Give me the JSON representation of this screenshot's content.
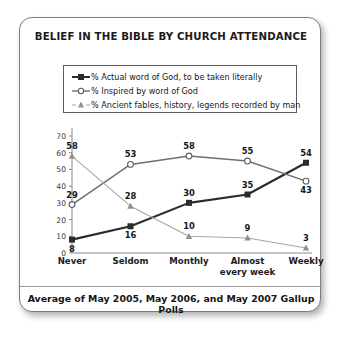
{
  "card": {
    "title": "BELIEF IN THE BIBLE BY CHURCH ATTENDANCE",
    "footer": "Average of May 2005, May 2006, and May 2007 Gallup Polls"
  },
  "legend": {
    "items": [
      {
        "label": "% Actual word of God, to be taken literally",
        "marker": "filled-square-marker",
        "color": "#2b2b2b"
      },
      {
        "label": "% Inspired by word of God",
        "marker": "open-circle-marker",
        "color": "#6f6f6f"
      },
      {
        "label": "% Ancient fables, history, legends recorded by man",
        "marker": "filled-triangle-marker",
        "color": "#9a9a9a"
      }
    ]
  },
  "chart_data": {
    "type": "line",
    "title": "BELIEF IN THE BIBLE BY CHURCH ATTENDANCE",
    "subtitle": "Average of May 2005, May 2006, and May 2007 Gallup Polls",
    "xlabel": "",
    "ylabel": "",
    "ylim": [
      0,
      70
    ],
    "yticks": [
      0,
      10,
      20,
      30,
      40,
      50,
      60,
      70
    ],
    "grid": false,
    "legend_position": "top",
    "show_data_labels": true,
    "categories": [
      "Never",
      "Seldom",
      "Monthly",
      "Almost\never y week",
      "Weekly"
    ],
    "category_labels": [
      "Never",
      "Seldom",
      "Monthly",
      "Almost\nevery week",
      "Weekly"
    ],
    "series": [
      {
        "name": "% Actual word of God, to be taken literally",
        "marker": "filled-square-marker",
        "color": "#2b2b2b",
        "line_width": 2.1,
        "values": [
          8,
          16,
          30,
          35,
          54
        ],
        "label_positions": [
          "below",
          "below",
          "above",
          "above",
          "above"
        ]
      },
      {
        "name": "% Inspired by word of God",
        "marker": "open-circle-marker",
        "color": "#6f6f6f",
        "line_width": 1.5,
        "values": [
          29,
          53,
          58,
          55,
          43
        ],
        "label_positions": [
          "above",
          "above",
          "above",
          "above",
          "below"
        ]
      },
      {
        "name": "% Ancient fables, history, legends recorded by man",
        "marker": "filled-triangle-marker",
        "color": "#a6a6a6",
        "line_width": 1.1,
        "values": [
          58,
          28,
          10,
          9,
          3
        ],
        "label_positions": [
          "above",
          "above",
          "above",
          "above",
          "above"
        ]
      }
    ]
  }
}
